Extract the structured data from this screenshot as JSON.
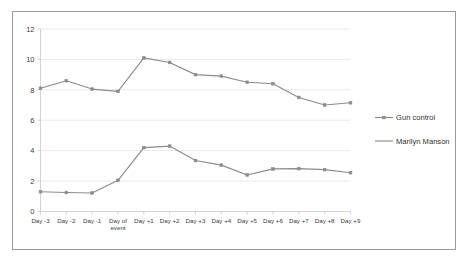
{
  "figure": {
    "background_color": "#ffffff",
    "border_color": "#9a9a9a"
  },
  "chart_data": {
    "type": "line",
    "title": "",
    "subtitle": "",
    "xlabel": "",
    "ylabel": "",
    "ylim": [
      0,
      12
    ],
    "ytick_values": [
      0,
      2,
      4,
      6,
      8,
      10,
      12
    ],
    "ytick_labels": [
      "0",
      "2",
      "4",
      "6",
      "8",
      "10",
      "12"
    ],
    "grid": true,
    "grid_axis": "y",
    "legend_position": "right",
    "categories": [
      "Day -3",
      "Day -2",
      "Day -1",
      "Day of event",
      "Day +1",
      "Day +2",
      "Day +3",
      "Day +4",
      "Day +5",
      "Day +6",
      "Day +7",
      "Day +8",
      "Day +9"
    ],
    "series": [
      {
        "name": "Gun control",
        "color": "#8c8c8c",
        "marker": "square",
        "values": [
          8.1,
          8.6,
          8.05,
          7.9,
          10.1,
          9.8,
          9.0,
          8.9,
          8.5,
          8.4,
          7.5,
          7.0,
          7.15
        ]
      },
      {
        "name": "Marilyn Manson",
        "color": "#8c8c8c",
        "marker": "square",
        "values": [
          1.3,
          1.25,
          1.22,
          2.05,
          4.2,
          4.3,
          3.35,
          3.05,
          2.4,
          2.8,
          2.82,
          2.75,
          2.55
        ]
      }
    ]
  },
  "legend": {
    "entries": [
      {
        "label": "Gun control"
      },
      {
        "label": "Marilyn Manson"
      }
    ]
  }
}
